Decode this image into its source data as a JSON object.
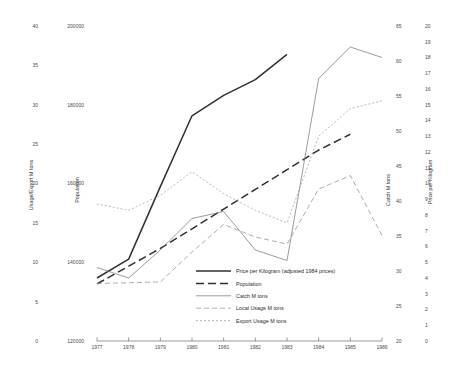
{
  "chart_data": {
    "type": "line",
    "title": "",
    "xlabel": "",
    "x": [
      1977,
      1978,
      1979,
      1980,
      1981,
      1982,
      1983,
      1984,
      1985,
      1986
    ],
    "xticklabels": [
      "1977",
      "1978",
      "1979",
      "1980",
      "1981",
      "1982",
      "1983",
      "1984",
      "1985",
      "1986"
    ],
    "grid": false,
    "legend_position": "center-bottom-inside",
    "axes": [
      {
        "id": "usage-export",
        "label": "Usage/Export M tons",
        "side": "left",
        "position": 1,
        "ylim": [
          0,
          40
        ],
        "ticks": [
          0,
          5,
          10,
          15,
          20,
          25,
          30,
          35,
          40
        ],
        "ticklabels": [
          "0",
          "5",
          "10",
          "15",
          "20",
          "25",
          "30",
          "35",
          "40"
        ]
      },
      {
        "id": "population",
        "label": "Population",
        "side": "left",
        "position": 2,
        "ylim": [
          120000,
          200000
        ],
        "ticks": [
          120000,
          140000,
          160000,
          180000,
          200000
        ],
        "ticklabels": [
          "120000",
          "140000",
          "160000",
          "180000",
          "200000"
        ]
      },
      {
        "id": "catch",
        "label": "Catch M tons",
        "side": "right",
        "position": 1,
        "ylim": [
          20,
          65
        ],
        "ticks": [
          20,
          25,
          30,
          35,
          40,
          45,
          50,
          55,
          60,
          65
        ],
        "ticklabels": [
          "20",
          "25",
          "30",
          "35",
          "40",
          "45",
          "50",
          "55",
          "60",
          "65"
        ]
      },
      {
        "id": "price",
        "label": "Price per Kilogram",
        "side": "right",
        "position": 2,
        "ylim": [
          0,
          20
        ],
        "ticks": [
          0,
          1,
          2,
          3,
          4,
          5,
          6,
          7,
          8,
          9,
          10,
          11,
          12,
          13,
          14,
          15,
          16,
          17,
          18,
          19,
          20
        ],
        "ticklabels": [
          "0",
          "1",
          "2",
          "3",
          "4",
          "5",
          "6",
          "7",
          "8",
          "9",
          "10",
          "11",
          "12",
          "13",
          "14",
          "15",
          "16",
          "17",
          "18",
          "19",
          "20"
        ]
      }
    ],
    "series": [
      {
        "name": "Price per Kilogram (adjusted 1984 prices)",
        "axis": "price",
        "style": "solid",
        "width": 1.5,
        "color": "#303030",
        "x": [
          1977,
          1978,
          1979,
          1980,
          1981,
          1982,
          1983
        ],
        "values": [
          4.0,
          5.2,
          9.8,
          14.3,
          15.6,
          16.6,
          18.2
        ]
      },
      {
        "name": "Population",
        "axis": "population",
        "style": "long-dash",
        "width": 1.5,
        "color": "#303030",
        "x": [
          1977,
          1978,
          1979,
          1980,
          1981,
          1982,
          1983,
          1984,
          1985
        ],
        "values": [
          134500,
          139000,
          143500,
          148500,
          153500,
          158500,
          163500,
          168500,
          172500
        ]
      },
      {
        "name": "Catch M tons",
        "axis": "catch",
        "style": "solid",
        "width": 0.7,
        "color": "#707070",
        "x": [
          1977,
          1978,
          1979,
          1980,
          1981,
          1982,
          1983,
          1984,
          1985,
          1986
        ],
        "values": [
          30.5,
          29.0,
          33.0,
          37.5,
          38.5,
          33.0,
          31.5,
          57.5,
          62.0,
          60.5
        ]
      },
      {
        "name": "Local Usage M tons",
        "axis": "usage-export",
        "style": "dash",
        "width": 0.7,
        "color": "#8a8a8a",
        "x": [
          1977,
          1978,
          1979,
          1980,
          1981,
          1982,
          1983,
          1984,
          1985,
          1986
        ],
        "values": [
          7.3,
          7.4,
          7.5,
          11.3,
          14.8,
          13.2,
          12.3,
          19.3,
          21.0,
          13.4
        ]
      },
      {
        "name": "Export Usage M tons",
        "axis": "usage-export",
        "style": "dotted",
        "width": 0.7,
        "color": "#9a9a9a",
        "x": [
          1977,
          1978,
          1979,
          1980,
          1981,
          1982,
          1983,
          1984,
          1985,
          1986
        ],
        "values": [
          17.4,
          16.6,
          18.5,
          21.5,
          18.7,
          16.6,
          15.0,
          26.0,
          29.5,
          30.5
        ]
      }
    ],
    "legend": [
      {
        "label": "Price per Kilogram (adjusted 1984 prices)",
        "style": "solid",
        "width": 1.5,
        "color": "#303030"
      },
      {
        "label": "Population",
        "style": "long-dash",
        "width": 1.5,
        "color": "#303030"
      },
      {
        "label": "Catch M tons",
        "style": "solid",
        "width": 0.7,
        "color": "#707070"
      },
      {
        "label": "Local Usage M tons",
        "style": "dash",
        "width": 0.7,
        "color": "#8a8a8a"
      },
      {
        "label": "Export Usage M tons",
        "style": "dotted",
        "width": 0.7,
        "color": "#9a9a9a"
      }
    ]
  }
}
